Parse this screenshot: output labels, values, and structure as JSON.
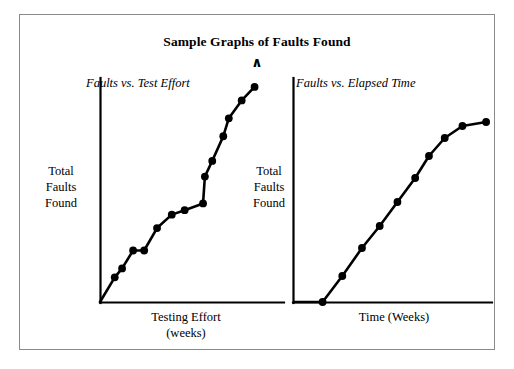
{
  "figure": {
    "title": "Sample Graphs of Faults Found",
    "caret_symbol": "∧",
    "background_color": "#ffffff",
    "border_color": "#8a8a8a",
    "ink_color": "#000000"
  },
  "panels": [
    {
      "id": "left",
      "title": "Faults vs. Test Effort",
      "y_axis_label": "Total\nFaults\nFound",
      "x_axis_label": "Testing Effort\n(weeks)"
    },
    {
      "id": "right",
      "title": "Faults vs. Elapsed Time",
      "y_axis_label": "Total\nFaults\nFound",
      "x_axis_label": "Time (Weeks)"
    }
  ],
  "chart_data": [
    {
      "type": "line",
      "title": "Faults vs. Test Effort",
      "xlabel": "Testing Effort (weeks)",
      "ylabel": "Total Faults Found",
      "grid": false,
      "legend": "none",
      "marker": "filled-circle",
      "xlim": [
        0,
        100
      ],
      "ylim": [
        0,
        100
      ],
      "x": [
        0,
        8,
        12,
        18,
        24,
        31,
        39,
        46,
        56,
        57,
        61,
        67,
        70,
        77,
        84
      ],
      "y": [
        0,
        11,
        15,
        23,
        23,
        33,
        39,
        41,
        44,
        56,
        63,
        74,
        82,
        90,
        96
      ],
      "annotation": "Step-like accumulation curve with a plateau near mid-range followed by a steep jump"
    },
    {
      "type": "line",
      "title": "Faults vs. Elapsed Time",
      "xlabel": "Time (Weeks)",
      "ylabel": "Total Faults Found",
      "grid": false,
      "legend": "none",
      "marker": "filled-circle",
      "xlim": [
        0,
        100
      ],
      "ylim": [
        0,
        100
      ],
      "x": [
        0,
        14,
        24,
        34,
        43,
        52,
        61,
        68,
        76,
        85,
        97
      ],
      "y": [
        0,
        0,
        13,
        27,
        38,
        50,
        62,
        73,
        82,
        88,
        90
      ],
      "annotation": "Classic S-shaped (sigmoid) cumulative curve flattening at the top"
    }
  ]
}
